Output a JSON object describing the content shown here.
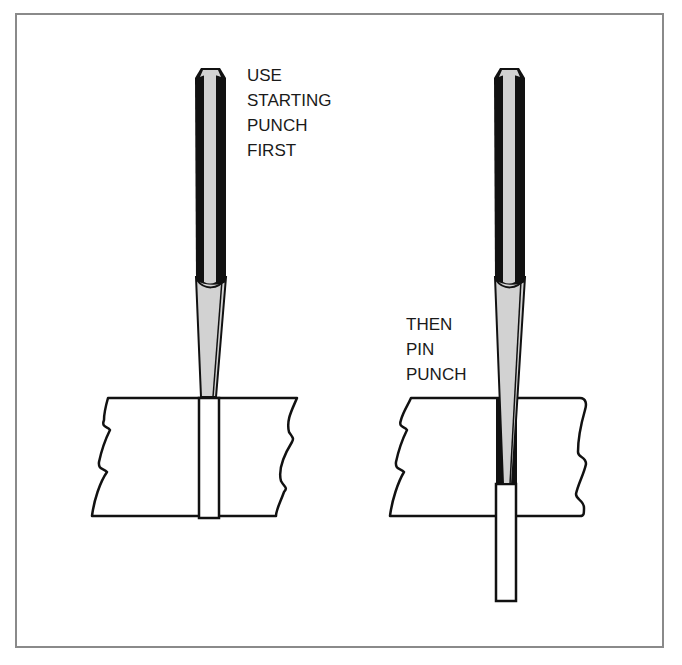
{
  "diagram": {
    "left_step": {
      "label_lines": [
        "USE",
        "STARTING",
        "PUNCH",
        "FIRST"
      ],
      "tool": "starting punch"
    },
    "right_step": {
      "label_lines": [
        "THEN",
        "PIN",
        "PUNCH"
      ],
      "tool": "pin punch"
    },
    "colors": {
      "frame": "#8a8a8a",
      "outline": "#111111",
      "punch_dark": "#111111",
      "punch_light": "#d2d2d2",
      "background": "#ffffff"
    }
  }
}
